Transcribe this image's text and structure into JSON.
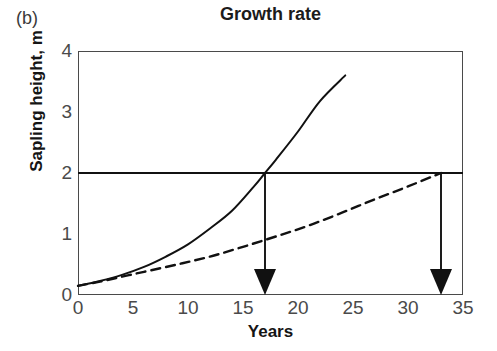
{
  "panel": {
    "label": "(b)"
  },
  "axis_titles": {
    "x": "Years",
    "y": "Sapling height, m"
  },
  "chart_data": {
    "type": "line",
    "title": "Growth rate",
    "xlabel": "Years",
    "ylabel": "Sapling height, m",
    "xlim": [
      0,
      35
    ],
    "ylim": [
      0,
      4
    ],
    "xticks": [
      0,
      5,
      10,
      15,
      20,
      25,
      30,
      35
    ],
    "yticks": [
      0,
      1,
      2,
      3,
      4
    ],
    "xtick_labels": [
      "0",
      "5",
      "10",
      "15",
      "20",
      "25",
      "30",
      "35"
    ],
    "ytick_labels": [
      "0",
      "1",
      "2",
      "3",
      "4"
    ],
    "grid": false,
    "legend": "none",
    "series": [
      {
        "name": "fast-growing sapling",
        "style": "solid",
        "color": "#111111",
        "x": [
          0,
          2,
          4,
          6,
          8,
          10,
          12,
          14,
          16,
          17,
          18,
          20,
          22,
          24.3
        ],
        "y": [
          0.15,
          0.23,
          0.33,
          0.46,
          0.63,
          0.83,
          1.09,
          1.38,
          1.78,
          2.0,
          2.22,
          2.68,
          3.18,
          3.6
        ]
      },
      {
        "name": "slow-growing sapling",
        "style": "dashed",
        "color": "#111111",
        "x": [
          0,
          2,
          4,
          6,
          9,
          12,
          15,
          18,
          21,
          24,
          27,
          30,
          33
        ],
        "y": [
          0.15,
          0.22,
          0.3,
          0.38,
          0.5,
          0.63,
          0.79,
          0.96,
          1.14,
          1.35,
          1.57,
          1.78,
          2.0
        ]
      }
    ],
    "reference_lines": [
      {
        "name": "threshold-height-line",
        "orientation": "horizontal",
        "value": 2,
        "from_x": 0,
        "to_x": 35,
        "style": "solid",
        "color": "#111111"
      }
    ],
    "annotations": [
      {
        "name": "arrow-fast-sapling",
        "type": "down-arrow",
        "x": 17,
        "from_y": 2,
        "to_y": 0,
        "label": ""
      },
      {
        "name": "arrow-slow-sapling",
        "type": "down-arrow",
        "x": 33,
        "from_y": 2,
        "to_y": 0,
        "label": ""
      }
    ]
  }
}
